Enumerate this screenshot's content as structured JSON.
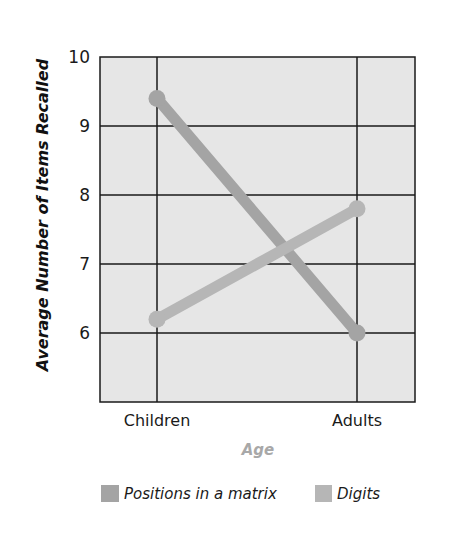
{
  "chart_data": {
    "type": "line",
    "title": "",
    "xlabel": "Age",
    "ylabel": "Average Number of Items Recalled",
    "categories": [
      "Children",
      "Adults"
    ],
    "series": [
      {
        "name": "Positions in a matrix",
        "values": [
          9.4,
          6.0
        ],
        "color": "#a4a4a4"
      },
      {
        "name": "Digits",
        "values": [
          6.2,
          7.8
        ],
        "color": "#b6b6b6"
      }
    ],
    "ylim": [
      5,
      10
    ],
    "yticks": [
      6,
      7,
      8,
      9,
      10
    ],
    "ytick_labels": [
      "6",
      "7",
      "8",
      "9",
      "10"
    ],
    "grid": true,
    "legend_position": "bottom"
  },
  "colors": {
    "plot_background": "#e6e6e6",
    "grid": "#1a1a1a",
    "xlabel": "#a8a8a8"
  }
}
